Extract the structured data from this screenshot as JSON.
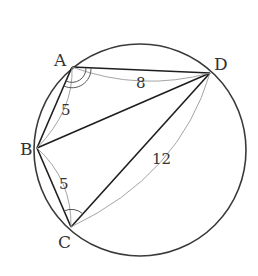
{
  "figure": {
    "type": "inscribed-quadrilateral",
    "circle": {
      "cx": 140,
      "cy": 150,
      "r": 106
    },
    "points": {
      "A": {
        "label": "A",
        "x": 72,
        "y": 67
      },
      "B": {
        "label": "B",
        "x": 37,
        "y": 148
      },
      "C": {
        "label": "C",
        "x": 71,
        "y": 227
      },
      "D": {
        "label": "D",
        "x": 210,
        "y": 73
      }
    },
    "segments": [
      "AB",
      "AD",
      "BD",
      "BC",
      "CD"
    ],
    "lengths": {
      "AB": "5",
      "AD": "8",
      "BC": "5",
      "CD": "12"
    },
    "angle_marks": {
      "A": "double-arc (angle BAD)",
      "C": "single-arc (angle BCD)"
    }
  }
}
